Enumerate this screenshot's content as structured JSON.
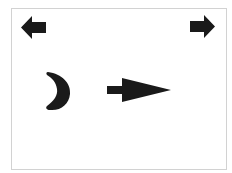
{
  "canvas": {
    "width": 232,
    "height": 173,
    "background": "#ffffff",
    "frame_border_color": "#d2d2d2"
  },
  "colors": {
    "shape_fill": "#1a1a1a"
  },
  "shapes": [
    {
      "id": "left-arrow",
      "icon": "arrow-left-icon",
      "direction": "left"
    },
    {
      "id": "right-arrow",
      "icon": "arrow-right-icon",
      "direction": "right"
    },
    {
      "id": "crescent",
      "icon": "crescent-icon",
      "orientation": "opening-left"
    },
    {
      "id": "pointer-arrow",
      "icon": "long-arrow-right-icon",
      "direction": "right"
    }
  ]
}
